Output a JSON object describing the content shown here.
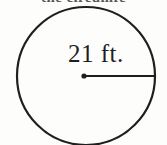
{
  "figure": {
    "type": "circle-with-radius-diagram",
    "background_color": "#fdfdfc",
    "stroke_color": "#1f1f1f",
    "clipped_caption": "the circumfe",
    "circle": {
      "center_x": 86,
      "center_y": 76,
      "radius_px": 69,
      "stroke_width": 2.2
    },
    "center_point": {
      "label": "center-dot",
      "x": 84,
      "y": 76,
      "radius_px": 2.6
    },
    "radius_segment": {
      "label": "radius-line",
      "x1": 84,
      "y1": 76,
      "x2": 154,
      "y2": 76,
      "stroke_width": 2.0
    },
    "measurement": {
      "value": "21",
      "unit": "ft.",
      "full_text": "21 ft.",
      "text_x": 68,
      "text_y": 62
    }
  }
}
